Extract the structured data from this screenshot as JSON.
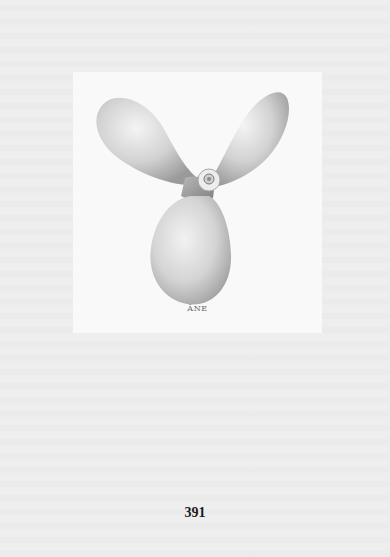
{
  "plate": {
    "illustration": "three-blade-propeller",
    "caption": "ÂNE"
  },
  "page_number": "391"
}
